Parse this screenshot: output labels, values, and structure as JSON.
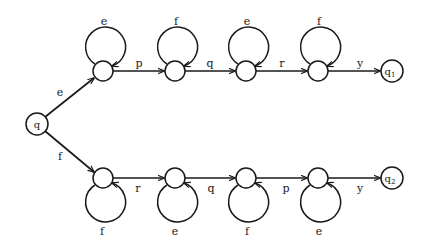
{
  "diagram": {
    "type": "finite-state automaton",
    "start_node": {
      "id": "q",
      "label": "q"
    },
    "top_branch": {
      "entry_label": "e",
      "loops": [
        "e",
        "f",
        "e",
        "f"
      ],
      "transitions": [
        "p",
        "q",
        "r"
      ],
      "exit_label": "y",
      "final_node": {
        "label": "q",
        "subscript": "1"
      }
    },
    "bottom_branch": {
      "entry_label": "f",
      "loops": [
        "f",
        "e",
        "f",
        "e"
      ],
      "transitions": [
        "r",
        "q",
        "p"
      ],
      "exit_label": "y",
      "final_node": {
        "label": "q",
        "subscript": "2"
      }
    },
    "colors": {
      "stroke": "#1a1a1a",
      "background": "#ffffff"
    }
  }
}
